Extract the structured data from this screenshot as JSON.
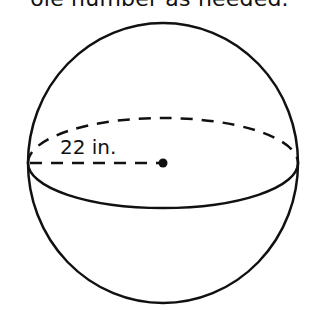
{
  "instruction_fragment": "ole number as needed.",
  "diagram": {
    "shape": "sphere",
    "radius_label": "22 in.",
    "center": {
      "x": 163,
      "y": 163
    },
    "radius_px": 138,
    "equator": {
      "rx": 136,
      "ry": 45
    },
    "stroke_color": "#111111",
    "background_color": "#ffffff"
  }
}
